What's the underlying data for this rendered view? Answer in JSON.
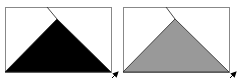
{
  "panels": [
    {
      "name": "black-triangle-panel",
      "rect": {
        "x": 5,
        "y": 7,
        "w": 106,
        "h": 65
      },
      "triangle": {
        "apex": [
          57,
          19
        ],
        "base_left": [
          5,
          72
        ],
        "base_right": [
          111,
          72
        ]
      },
      "fold_line": {
        "from": [
          47,
          7
        ],
        "to": [
          57,
          19
        ]
      },
      "fill": "#000000",
      "arrow": {
        "from": [
          112,
          78
        ],
        "to": [
          118,
          72
        ]
      }
    },
    {
      "name": "gray-triangle-panel",
      "rect": {
        "x": 123,
        "y": 7,
        "w": 106,
        "h": 65
      },
      "triangle": {
        "apex": [
          175,
          19
        ],
        "base_left": [
          123,
          72
        ],
        "base_right": [
          229,
          72
        ]
      },
      "fold_line": {
        "from": [
          166,
          7
        ],
        "to": [
          175,
          19
        ]
      },
      "fill": "#999999",
      "arrow": {
        "from": [
          230,
          78
        ],
        "to": [
          236,
          72
        ]
      }
    }
  ],
  "colors": {
    "border": "#888888",
    "line": "#333333",
    "arrow": "#000000"
  }
}
